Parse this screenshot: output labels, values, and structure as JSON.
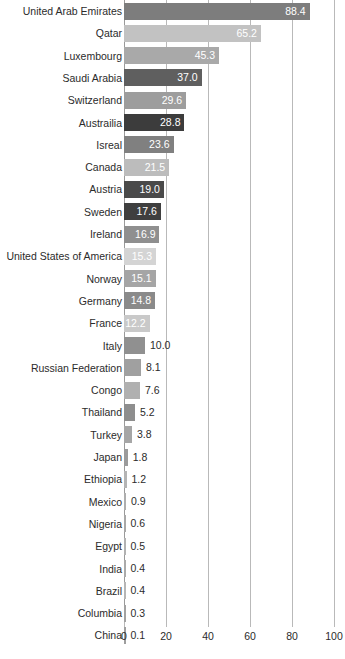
{
  "chart_data": {
    "type": "bar",
    "orientation": "horizontal",
    "title": "",
    "subtitle": "",
    "xlabel": "",
    "ylabel": "",
    "xlim": [
      0,
      100
    ],
    "ylim": null,
    "grid": true,
    "legend": null,
    "x_ticks": [
      "0",
      "20",
      "40",
      "60",
      "80",
      "100"
    ],
    "x_tick_values": [
      0,
      20,
      40,
      60,
      80,
      100
    ],
    "categories": [
      "United Arab Emirates",
      "Qatar",
      "Luxembourg",
      "Saudi Arabia",
      "Switzerland",
      "Austrailia",
      "Isreal",
      "Canada",
      "Austria",
      "Sweden",
      "Ireland",
      "United States of America",
      "Norway",
      "Germany",
      "France",
      "Italy",
      "Russian Federation",
      "Congo",
      "Thailand",
      "Turkey",
      "Japan",
      "Ethiopia",
      "Mexico",
      "Nigeria",
      "Egypt",
      "India",
      "Brazil",
      "Columbia",
      "China"
    ],
    "values": [
      88.4,
      65.2,
      45.3,
      37.0,
      29.6,
      28.8,
      23.6,
      21.5,
      19.0,
      17.6,
      16.9,
      15.3,
      15.1,
      14.8,
      12.2,
      10.0,
      8.1,
      7.6,
      5.2,
      3.8,
      1.8,
      1.2,
      0.9,
      0.6,
      0.5,
      0.4,
      0.4,
      0.3,
      0.1
    ],
    "value_labels": [
      "88.4",
      "65.2",
      "45.3",
      "37.0",
      "29.6",
      "28.8",
      "23.6",
      "21.5",
      "19.0",
      "17.6",
      "16.9",
      "15.3",
      "15.1",
      "14.8",
      "12.2",
      "10.0",
      "8.1",
      "7.6",
      "5.2",
      "3.8",
      "1.8",
      "1.2",
      "0.9",
      "0.6",
      "0.5",
      "0.4",
      "0.4",
      "0.3",
      "0.1"
    ],
    "bar_colors": [
      "#7d7d7d",
      "#c2c2c2",
      "#a9a9a9",
      "#5f5f5f",
      "#9d9d9d",
      "#3c3c3c",
      "#808080",
      "#bcbcbc",
      "#4a4a4a",
      "#3f3f3f",
      "#8f8f8f",
      "#d4d4d4",
      "#a5a5a5",
      "#8a8a8a",
      "#c9c9c9",
      "#909090",
      "#a0a0a0",
      "#b0b0b0",
      "#8e8e8e",
      "#a6a6a6",
      "#9b9b9b",
      "#b4b4b4",
      "#aeaeae",
      "#a8a8a8",
      "#b2b2b2",
      "#aaaaaa",
      "#b6b6b6",
      "#a2a2a2",
      "#9e9e9e"
    ],
    "label_inside_flags": [
      true,
      true,
      true,
      true,
      true,
      true,
      true,
      true,
      true,
      true,
      true,
      true,
      true,
      true,
      true,
      false,
      false,
      false,
      false,
      false,
      false,
      false,
      false,
      false,
      false,
      false,
      false,
      false,
      false
    ],
    "axis_color": "#b9b9b9",
    "text_color": "#2b2b2b",
    "inside_label_color": "#ffffff",
    "background": "#ffffff"
  }
}
